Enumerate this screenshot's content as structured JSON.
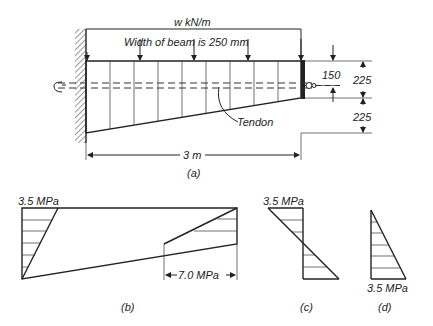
{
  "figure_a": {
    "load_label": "w kN/m",
    "width_note": "Width of beam is 250 mm",
    "eccentricity_label": "150",
    "depth_upper_label": "225",
    "depth_lower_label": "225",
    "tendon_label": "Tendon",
    "span_label": "3 m",
    "caption": "(a)"
  },
  "figure_b": {
    "top_stress_label": "3.5 MPa",
    "bottom_stress_label": "7.0 MPa",
    "caption": "(b)"
  },
  "figure_c": {
    "stress_label": "3.5 MPa",
    "caption": "(c)"
  },
  "figure_d": {
    "stress_label": "3.5 MPa",
    "caption": "(d)"
  }
}
